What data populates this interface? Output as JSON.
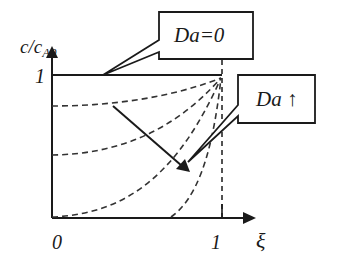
{
  "diagram": {
    "y_axis": {
      "label_main": "c/c",
      "label_sub": "A0",
      "tick_1": "1"
    },
    "x_axis": {
      "label": "ξ",
      "tick_0": "0",
      "tick_1": "1"
    },
    "callouts": {
      "da_zero": "Da=0",
      "da_increase": "Da ↑"
    },
    "colors": {
      "ink": "#1a1a1a",
      "background": "#ffffff"
    }
  }
}
